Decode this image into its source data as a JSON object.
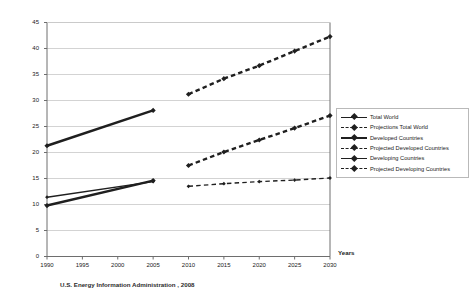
{
  "chart_data": {
    "type": "line",
    "title": "",
    "xlabel": "Years",
    "ylabel": "Billion Metric Tons CO2",
    "source_note": "U.S. Energy Information Administration , 2008",
    "xlim": [
      1990,
      2030
    ],
    "ylim": [
      0,
      45
    ],
    "x_ticks": [
      1990,
      1995,
      2000,
      2005,
      2010,
      2015,
      2020,
      2025,
      2030
    ],
    "y_ticks": [
      0,
      5,
      10,
      15,
      20,
      25,
      30,
      35,
      40,
      45
    ],
    "grid": "horizontal",
    "legend_position": "right",
    "series": [
      {
        "name": "Total World",
        "style": "solid",
        "x": [
          1990,
          2005
        ],
        "values": [
          21.3,
          28.1
        ]
      },
      {
        "name": "Projections Total World",
        "style": "dashed",
        "x": [
          2010,
          2015,
          2020,
          2025,
          2030
        ],
        "values": [
          31.2,
          34.2,
          36.7,
          39.5,
          42.3
        ]
      },
      {
        "name": "Developed Countries",
        "style": "solid-thin",
        "x": [
          1990,
          2005
        ],
        "values": [
          11.4,
          14.4
        ]
      },
      {
        "name": "Projected Developed Countries",
        "style": "dashed-thin",
        "x": [
          2010,
          2015,
          2020,
          2025,
          2030
        ],
        "values": [
          13.5,
          14.0,
          14.4,
          14.7,
          15.1
        ]
      },
      {
        "name": "Developing Countries",
        "style": "solid",
        "x": [
          1990,
          2005
        ],
        "values": [
          9.8,
          14.6
        ]
      },
      {
        "name": "Projected Developing Countries",
        "style": "dashed",
        "x": [
          2010,
          2015,
          2020,
          2025,
          2030
        ],
        "values": [
          17.5,
          20.1,
          22.4,
          24.7,
          27.1
        ]
      }
    ]
  },
  "legend": {
    "entries": [
      {
        "label": "Total World",
        "style": "solid"
      },
      {
        "label": "Projections Total World",
        "style": "dashed"
      },
      {
        "label": "Developed Countries",
        "style": "solid-thin"
      },
      {
        "label": "Projected Developed Countries",
        "style": "dashed-thin"
      },
      {
        "label": "Developing Countries",
        "style": "solid"
      },
      {
        "label": "Projected Developing Countries",
        "style": "dashed"
      }
    ]
  },
  "colors": {
    "line": "#1f1f1f",
    "grid": "#c8c8c8",
    "axis": "#6e6e6e",
    "background": "#ffffff"
  }
}
